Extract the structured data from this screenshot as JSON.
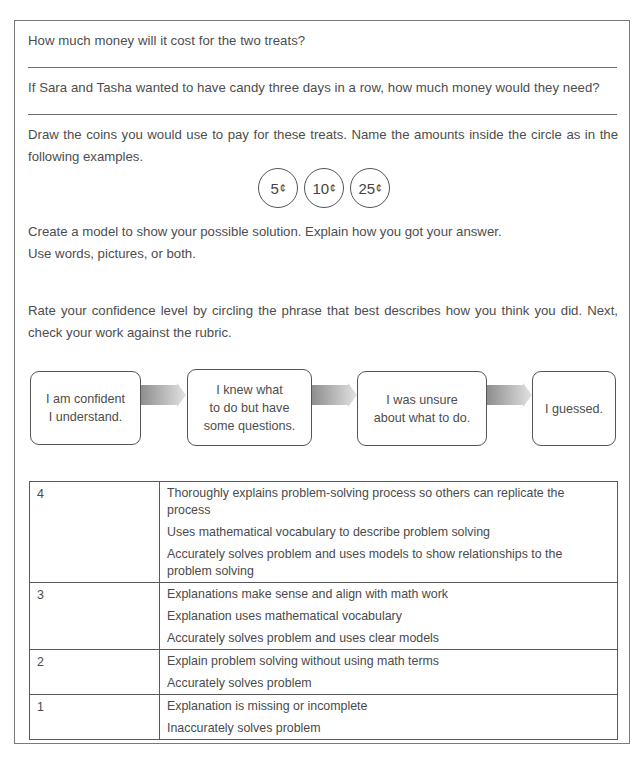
{
  "questions": {
    "q1": "How much money will it cost for the two treats?",
    "q2": "If Sara and Tasha wanted to have candy three days in a row, how much money would they need?"
  },
  "coins_section": {
    "instruction": "Draw the coins you would use to pay for these treats. Name the amounts inside the circle as in the following examples.",
    "coins": [
      {
        "value": "5",
        "unit": "¢"
      },
      {
        "value": "10",
        "unit": "¢"
      },
      {
        "value": "25",
        "unit": "¢"
      }
    ]
  },
  "model_section": {
    "line1": "Create a model to show your possible solution. Explain how you got your answer.",
    "line2": "Use words, pictures, or both."
  },
  "confidence": {
    "instruction": "Rate your confidence level by circling the phrase that best describes how you think you did. Next, check your work against the rubric.",
    "levels": [
      {
        "line1": "I am confident",
        "line2": "I understand.",
        "line3": ""
      },
      {
        "line1": "I knew what",
        "line2": "to do but have",
        "line3": "some questions."
      },
      {
        "line1": "I was unsure",
        "line2": "about what to do.",
        "line3": ""
      },
      {
        "line1": "I guessed.",
        "line2": "",
        "line3": ""
      }
    ]
  },
  "rubric": {
    "rows": [
      {
        "score": "4",
        "criteria": [
          "Thoroughly explains problem-solving process so others can replicate the process",
          "Uses mathematical vocabulary to describe problem solving",
          "Accurately solves problem and uses models to show relationships to the problem solving"
        ]
      },
      {
        "score": "3",
        "criteria": [
          "Explanations make sense and align with math work",
          "Explanation uses mathematical vocabulary",
          "Accurately solves problem and uses clear models"
        ]
      },
      {
        "score": "2",
        "criteria": [
          "Explain problem solving without using math terms",
          "Accurately solves problem"
        ]
      },
      {
        "score": "1",
        "criteria": [
          "Explanation is missing or incomplete",
          "Inaccurately solves problem"
        ]
      }
    ]
  }
}
